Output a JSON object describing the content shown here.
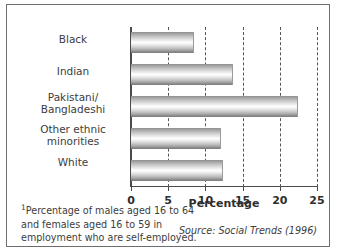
{
  "chart_data": {
    "type": "bar",
    "orientation": "horizontal",
    "title": "",
    "categories": [
      "Black",
      "Indian",
      "Pakistani/\nBangladeshi",
      "Other ethnic\nminorities",
      "White"
    ],
    "category_lines": [
      [
        "Black"
      ],
      [
        "Indian"
      ],
      [
        "Pakistani/",
        "Bangladeshi"
      ],
      [
        "Other ethnic",
        "minorities"
      ],
      [
        "White"
      ]
    ],
    "values": [
      8.5,
      13.7,
      22.5,
      12.1,
      12.3
    ],
    "xlabel": "Percentage",
    "ylabel": "",
    "xlim": [
      0,
      25
    ],
    "xticks": [
      0,
      5,
      10,
      15,
      20,
      25
    ],
    "xtick_labels": [
      "0",
      "5",
      "10",
      "15",
      "20",
      "25"
    ],
    "grid": true,
    "grid_style": "dashed-vertical",
    "legend": "none"
  },
  "footnote": {
    "marker": "1",
    "line1": "Percentage of males aged 16 to 64",
    "line2": "and females aged 16 to 59 in",
    "line3": "employment who are self-employed."
  },
  "source": {
    "label": "Source:",
    "publication": "Social Trends",
    "year": "(1996)",
    "full": "Source: Social Trends (1996)"
  },
  "colors": {
    "bar_dark": "#8a8a8a",
    "bar_light": "#ffffff",
    "axis": "#4a4a4a",
    "grid": "#555555",
    "frame": "#6e6e6e",
    "text": "#3d3d3d"
  }
}
